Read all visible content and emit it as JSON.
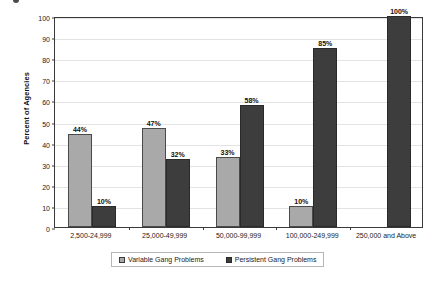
{
  "figure": {
    "marker_label": ""
  },
  "chart_data": {
    "type": "bar",
    "title": "",
    "xlabel": "",
    "ylabel": "Percent of Agencies",
    "ylim": [
      0,
      100
    ],
    "ytick_step": 10,
    "yticks": [
      0,
      10,
      20,
      30,
      40,
      50,
      60,
      70,
      80,
      90,
      100
    ],
    "grid": true,
    "legend_position": "bottom",
    "value_label_suffix": "%",
    "categories": [
      "2,500-24,999",
      "25,000-49,999",
      "50,000-99,999",
      "100,000-249,999",
      "250,000 and Above"
    ],
    "series": [
      {
        "name": "Variable Gang Problems",
        "color": "#a9a9a9",
        "values": [
          44,
          47,
          33,
          10,
          0
        ],
        "labels": [
          "44%",
          "47%",
          "33%",
          "10%",
          ""
        ]
      },
      {
        "name": "Persistent Gang Problems",
        "color": "#3d3d3d",
        "values": [
          10,
          32,
          58,
          85,
          100
        ],
        "labels": [
          "10%",
          "32%",
          "58%",
          "85%",
          "100%"
        ]
      }
    ]
  },
  "colors": {
    "variable": "#a9a9a9",
    "persistent": "#3d3d3d",
    "axis": "#3a3a3a",
    "grid": "#e3e3e3",
    "background": "#ffffff"
  }
}
